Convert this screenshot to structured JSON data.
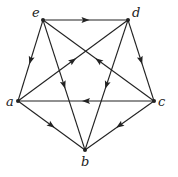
{
  "diagram": {
    "type": "directed-graph",
    "nodes": [
      {
        "id": "e",
        "label": "e",
        "x": 43,
        "y": 20,
        "lx": 32,
        "ly": 17
      },
      {
        "id": "d",
        "label": "d",
        "x": 128,
        "y": 20,
        "lx": 132,
        "ly": 17
      },
      {
        "id": "a",
        "label": "a",
        "x": 18,
        "y": 101,
        "lx": 6,
        "ly": 106
      },
      {
        "id": "c",
        "label": "c",
        "x": 154,
        "y": 101,
        "lx": 158,
        "ly": 106
      },
      {
        "id": "b",
        "label": "b",
        "x": 85,
        "y": 150,
        "lx": 81,
        "ly": 166
      }
    ],
    "edges": [
      {
        "from": "e",
        "to": "d"
      },
      {
        "from": "e",
        "to": "a"
      },
      {
        "from": "e",
        "to": "b"
      },
      {
        "from": "c",
        "to": "e"
      },
      {
        "from": "a",
        "to": "d"
      },
      {
        "from": "d",
        "to": "b"
      },
      {
        "from": "d",
        "to": "c"
      },
      {
        "from": "c",
        "to": "a"
      },
      {
        "from": "a",
        "to": "b"
      },
      {
        "from": "c",
        "to": "b"
      }
    ]
  }
}
